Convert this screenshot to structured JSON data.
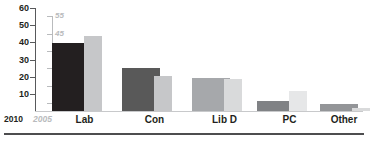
{
  "chart_data": {
    "type": "bar",
    "title": "",
    "xlabel": "",
    "ylabel": "",
    "categories": [
      "Lab",
      "Con",
      "Lib D",
      "PC",
      "Other"
    ],
    "series": [
      {
        "name": "2010",
        "color": "#231f20",
        "axis": "left-2010",
        "values": [
          41,
          26,
          20,
          6,
          4
        ]
      },
      {
        "name": "2005",
        "color": "#c6c7c9",
        "axis": "right-2005",
        "values": [
          45,
          21,
          19,
          12,
          2
        ]
      }
    ],
    "axes": {
      "left": {
        "name": "2010",
        "ticks": [
          60,
          50,
          40,
          30,
          20,
          10
        ],
        "tick_labels": [
          "60",
          "50",
          "40",
          "30",
          "20",
          "10"
        ],
        "range": [
          0,
          62
        ],
        "color": "#231f20",
        "line_color": "#58595b"
      },
      "right": {
        "name": "2005",
        "ticks": [
          55,
          45,
          35,
          25,
          15,
          5
        ],
        "tick_labels": [
          "55",
          "45",
          "35",
          "25",
          "15",
          "5"
        ],
        "range": [
          0,
          62
        ],
        "color": "#b9bbbd",
        "line_color": "#b9bbbd"
      }
    },
    "grid": false,
    "legend": "none",
    "bar_colors": {
      "lab_2010": "#231f20",
      "lab_2005": "#c6c7c9",
      "con_2010": "#595959",
      "con_2005": "#c6c7c9",
      "libd_2010": "#a6a8ab",
      "libd_2005": "#d9dadb",
      "pc_2010": "#808285",
      "pc_2005": "#e6e7e8",
      "other_2010": "#939598",
      "other_2005": "#d9dadb"
    }
  },
  "axis_labels": {
    "series_2010": "2010",
    "series_2005": "2005"
  },
  "colors": {
    "baseline": "#c8c9cb",
    "bottom_rule": "#4d4d4f",
    "background": "#ffffff"
  }
}
